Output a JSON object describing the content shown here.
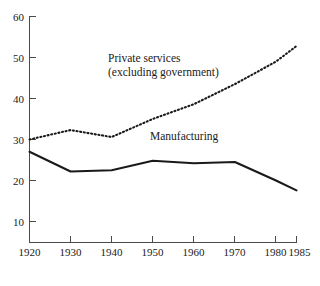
{
  "chart_data": {
    "type": "line",
    "title": "",
    "subtitle": "",
    "xlabel": "",
    "ylabel": "",
    "xlim": [
      1920,
      1985
    ],
    "ylim": [
      0,
      60
    ],
    "grid": false,
    "legend_position": "inline-annotation",
    "x_ticks": [
      1920,
      1930,
      1940,
      1950,
      1960,
      1970,
      1980,
      1985
    ],
    "x_tick_labels": [
      "1920",
      "1930",
      "1940",
      "1950",
      "1960",
      "1970",
      "1980",
      "1985"
    ],
    "y_ticks": [
      10,
      20,
      30,
      40,
      50,
      60
    ],
    "y_tick_labels": [
      "10",
      "20",
      "30",
      "40",
      "50",
      "60"
    ],
    "x": [
      1920,
      1930,
      1940,
      1950,
      1960,
      1970,
      1980,
      1985
    ],
    "series": [
      {
        "name": "Private services (excluding government)",
        "style": "dotted",
        "color": "#1a1a1a",
        "values": [
          30.0,
          32.3,
          30.6,
          35.0,
          38.6,
          43.5,
          49.0,
          52.8
        ]
      },
      {
        "name": "Manufacturing",
        "style": "solid",
        "color": "#1a1a1a",
        "values": [
          27.0,
          22.2,
          22.5,
          24.8,
          24.2,
          24.5,
          20.0,
          17.6
        ]
      }
    ],
    "annotations": [
      {
        "id": "private-services-label",
        "text_line_1": "Private services",
        "text_line_2": "(excluding government)",
        "x_px": 108,
        "y_px": 62
      },
      {
        "id": "manufacturing-label",
        "text_line_1": "Manufacturing",
        "text_line_2": "",
        "x_px": 150,
        "y_px": 140
      }
    ]
  },
  "axes": {
    "x_axis_name": "year-axis",
    "y_axis_name": "percent-axis"
  }
}
